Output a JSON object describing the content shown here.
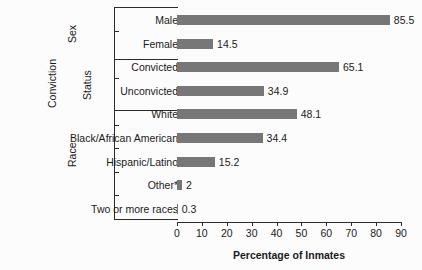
{
  "chart_data": {
    "type": "bar",
    "orientation": "horizontal",
    "title": "",
    "xlabel": "Percentage of Inmates",
    "ylabel": "",
    "xlim": [
      0,
      90
    ],
    "xticks": [
      0,
      10,
      20,
      30,
      40,
      50,
      60,
      70,
      80,
      90
    ],
    "grid": false,
    "legend": null,
    "bar_color": "#777777",
    "axis_color": "#2b2b2b",
    "categories": [
      "Male",
      "Female",
      "Convicted",
      "Unconvicted",
      "White",
      "Black/African American",
      "Hispanic/Latino",
      "Other*",
      "Two or more races"
    ],
    "values": [
      85.5,
      14.5,
      65.1,
      34.9,
      48.1,
      34.4,
      15.2,
      2,
      0.3
    ],
    "value_labels": [
      "85.5",
      "14.5",
      "65.1",
      "34.9",
      "48.1",
      "34.4",
      "15.2",
      "2",
      "0.3"
    ],
    "groups": [
      {
        "label": "Sex",
        "label_lines": [
          "Sex"
        ],
        "categories": [
          "Male",
          "Female"
        ]
      },
      {
        "label": "Conviction Status",
        "label_lines": [
          "Conviction",
          "Status"
        ],
        "categories": [
          "Convicted",
          "Unconvicted"
        ]
      },
      {
        "label": "Race",
        "label_lines": [
          "Race"
        ],
        "categories": [
          "White",
          "Black/African American",
          "Hispanic/Latino",
          "Other*",
          "Two or more races"
        ]
      }
    ]
  },
  "rows": [
    {
      "label": "Male",
      "value": 85.5,
      "value_label": "85.5",
      "group": "Sex"
    },
    {
      "label": "Female",
      "value": 14.5,
      "value_label": "14.5",
      "group": "Sex"
    },
    {
      "label": "Convicted",
      "value": 65.1,
      "value_label": "65.1",
      "group": "Conviction Status"
    },
    {
      "label": "Unconvicted",
      "value": 34.9,
      "value_label": "34.9",
      "group": "Conviction Status"
    },
    {
      "label": "White",
      "value": 48.1,
      "value_label": "48.1",
      "group": "Race"
    },
    {
      "label": "Black/African American",
      "value": 34.4,
      "value_label": "34.4",
      "group": "Race"
    },
    {
      "label": "Hispanic/Latino",
      "value": 15.2,
      "value_label": "15.2",
      "group": "Race"
    },
    {
      "label": "Other*",
      "value": 2,
      "value_label": "2",
      "group": "Race"
    },
    {
      "label": "Two or more races",
      "value": 0.3,
      "value_label": "0.3",
      "group": "Race"
    }
  ],
  "group_labels": {
    "sex": "Sex",
    "conviction_line1": "Conviction",
    "conviction_line2": "Status",
    "race": "Race"
  },
  "axis": {
    "title": "Percentage of Inmates",
    "ticks": [
      "0",
      "10",
      "20",
      "30",
      "40",
      "50",
      "60",
      "70",
      "80",
      "90"
    ]
  },
  "title_sliver": ""
}
